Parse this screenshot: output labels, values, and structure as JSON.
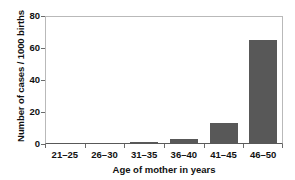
{
  "chart_data": {
    "type": "bar",
    "title": "",
    "subtitle": "",
    "xlabel": "Age of mother in years",
    "ylabel": "Number of cases / 1000 births",
    "categories": [
      "21–25",
      "26–30",
      "31–35",
      "36–40",
      "41–45",
      "46–50"
    ],
    "values": [
      0.3,
      0.4,
      1.5,
      3,
      13,
      65
    ],
    "ylim": [
      0,
      80
    ],
    "yticks": [
      0,
      20,
      40,
      60,
      80
    ],
    "ytick_labels": [
      "0",
      "20",
      "40",
      "60",
      "80"
    ],
    "grid": false,
    "legend": false,
    "legend_position": "none",
    "bar_color": "#585858",
    "axis_color": "#5a5a5a",
    "frame_color": "#b9b9b9",
    "background": "#ffffff"
  },
  "axes": {
    "y": {
      "title": "Number of cases / 1000 births",
      "ticks": [
        {
          "label": "80",
          "value": 80
        },
        {
          "label": "60",
          "value": 60
        },
        {
          "label": "40",
          "value": 40
        },
        {
          "label": "20",
          "value": 20
        },
        {
          "label": "0",
          "value": 0
        }
      ]
    },
    "x": {
      "title": "Age of mother in years",
      "ticks": [
        {
          "label": "21–25"
        },
        {
          "label": "26–30"
        },
        {
          "label": "31–35"
        },
        {
          "label": "36–40"
        },
        {
          "label": "41–45"
        },
        {
          "label": "46–50"
        }
      ]
    }
  }
}
